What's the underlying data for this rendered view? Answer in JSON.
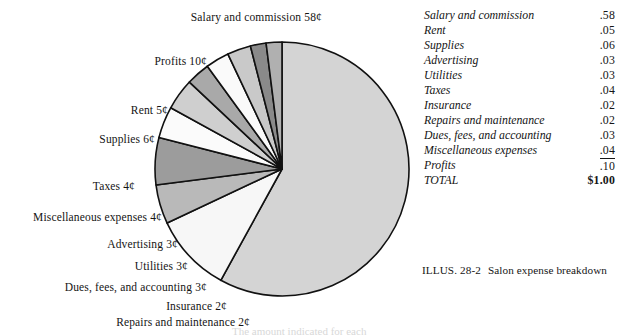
{
  "chart_data": {
    "type": "pie",
    "title": "",
    "unit": "cents per dollar",
    "categories": [
      "Salary and commission",
      "Profits",
      "Rent",
      "Supplies",
      "Taxes",
      "Miscellaneous expenses",
      "Advertising",
      "Utilities",
      "Dues, fees, and accounting",
      "Insurance",
      "Repairs and maintenance"
    ],
    "values": [
      58,
      10,
      5,
      6,
      4,
      4,
      3,
      3,
      3,
      2,
      2
    ],
    "labels": [
      "Salary and commission 58¢",
      "Profits 10¢",
      "Rent 5¢",
      "Supplies 6¢",
      "Taxes 4¢",
      "Miscellaneous expenses 4¢",
      "Advertising 3¢",
      "Utilities 3¢",
      "Dues, fees, and accounting 3¢",
      "Insurance 2¢",
      "Repairs and maintenance 2¢"
    ],
    "slice_fills": [
      "#d4d4d4",
      "#f7f7f7",
      "#b9b9b9",
      "#9c9c9c",
      "#fbfbfb",
      "#cfcfcf",
      "#a9a9a9",
      "#fafafa",
      "#c9c9c9",
      "#8a8a8a",
      "#b0b0b0"
    ],
    "legend": "none",
    "grid": false
  },
  "table": {
    "rows": [
      {
        "name": "Salary and commission",
        "value": ".58"
      },
      {
        "name": "Rent",
        "value": ".05"
      },
      {
        "name": "Supplies",
        "value": ".06"
      },
      {
        "name": "Advertising",
        "value": ".03"
      },
      {
        "name": "Utilities",
        "value": ".03"
      },
      {
        "name": "Taxes",
        "value": ".04"
      },
      {
        "name": "Insurance",
        "value": ".02"
      },
      {
        "name": "Repairs and maintenance",
        "value": ".02"
      },
      {
        "name": "Dues, fees, and accounting",
        "value": ".03"
      },
      {
        "name": "Miscellaneous expenses",
        "value": ".04"
      },
      {
        "name": "Profits",
        "value": ".10"
      },
      {
        "name": "TOTAL",
        "value": "$1.00"
      }
    ]
  },
  "caption": {
    "number": "ILLUS. 28-2",
    "text": "Salon expense breakdown"
  },
  "footnote": {
    "text": "The amount indicated for each"
  }
}
